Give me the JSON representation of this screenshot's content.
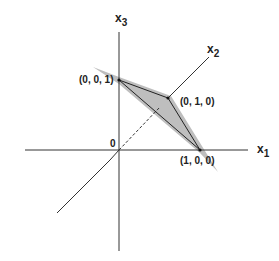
{
  "diagram": {
    "axes": {
      "x1_label": "x",
      "x1_sub": "1",
      "x2_label": "x",
      "x2_sub": "2",
      "x3_label": "x",
      "x3_sub": "3",
      "origin_label": "0"
    },
    "points": {
      "p001": "(0, 0, 1)",
      "p010": "(0, 1, 0)",
      "p100": "(1, 0, 0)"
    },
    "colors": {
      "axis": "#333333",
      "shade": "#b3b3b3",
      "edge": "#222222"
    }
  }
}
